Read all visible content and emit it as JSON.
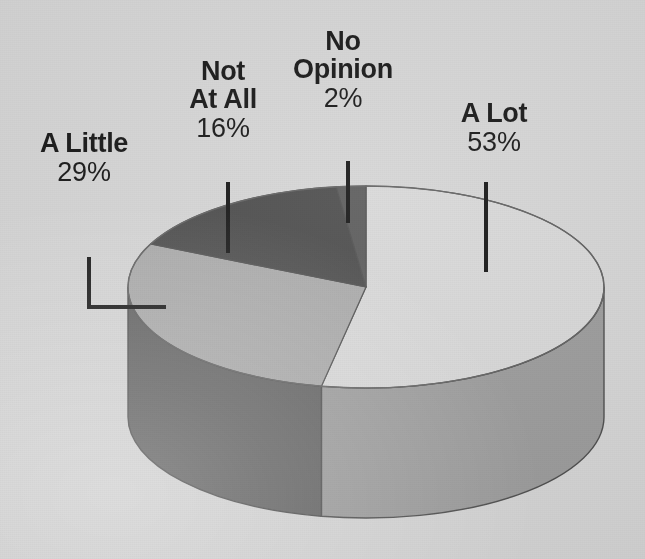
{
  "chart_data": {
    "type": "pie",
    "title": "",
    "subtitle": "",
    "xlabel": "",
    "ylabel": "",
    "three_d": true,
    "legend_position": "none",
    "grid": false,
    "categories": [
      "A Lot",
      "A Little",
      "Not At All",
      "No Opinion"
    ],
    "values": [
      53,
      29,
      16,
      2
    ],
    "value_unit": "%",
    "slices": [
      {
        "label": "A Lot",
        "value": 53,
        "value_text": "53%",
        "top_color": "#d8d8d8",
        "side_color": "#9a9a9a",
        "start_angle_deg": 0,
        "end_angle_deg": 190.8
      },
      {
        "label": "A Little",
        "value": 29,
        "value_text": "29%",
        "top_color": "#a8a8a8",
        "side_color": "#5e5e5e",
        "start_angle_deg": 190.8,
        "end_angle_deg": 295.2
      },
      {
        "label": "Not At All",
        "value": 16,
        "value_text": "16%",
        "top_color": "#494949",
        "side_color": "#3a3a3a",
        "start_angle_deg": 295.2,
        "end_angle_deg": 352.8
      },
      {
        "label": "No Opinion",
        "value": 2,
        "value_text": "2%",
        "top_color": "#585858",
        "side_color": "#3a3a3a",
        "start_angle_deg": 352.8,
        "end_angle_deg": 360
      }
    ]
  },
  "labels": {
    "a_lot": {
      "name": "A Lot",
      "value": "53%"
    },
    "no_opinion": {
      "name_line1": "No",
      "name_line2": "Opinion",
      "value": "2%"
    },
    "not_at_all": {
      "name_line1": "Not",
      "name_line2": "At All",
      "value": "16%"
    },
    "a_little": {
      "name": "A Little",
      "value": "29%"
    }
  },
  "colors": {
    "background": "#d5d5d5",
    "text": "#111111",
    "leader_line": "#111111",
    "slice_a_lot_top": "#d8d8d8",
    "slice_a_lot_side": "#9a9a9a",
    "slice_a_little_top": "#a8a8a8",
    "slice_a_little_side": "#5e5e5e",
    "slice_not_at_all_top": "#494949",
    "slice_not_at_all_side": "#3a3a3a",
    "slice_no_opinion_top": "#585858",
    "outline": "#4a4a4a"
  }
}
